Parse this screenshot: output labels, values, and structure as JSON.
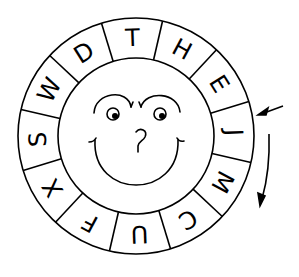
{
  "diagram": {
    "type": "cipher-wheel",
    "ring_letters_clockwise_from_top": [
      "T",
      "H",
      "E",
      "J",
      "M",
      "C",
      "U",
      "F",
      "X",
      "S",
      "W",
      "D"
    ],
    "segments": 12,
    "center_face": {
      "features": [
        "eyebrows",
        "eyes",
        "question-mark-nose",
        "smile"
      ],
      "nose_glyph": "?"
    },
    "arrows": [
      {
        "name": "pointer-arrow",
        "points_to": "J segment",
        "direction": "inward"
      },
      {
        "name": "rotation-arrow",
        "direction": "clockwise"
      }
    ],
    "colors": {
      "line": "#000000",
      "background": "#ffffff"
    }
  }
}
